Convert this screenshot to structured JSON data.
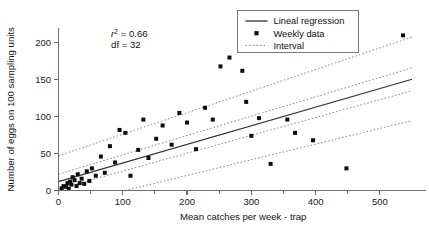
{
  "chart_data": {
    "type": "scatter",
    "title": "",
    "xlabel": "Mean catches per week - trap",
    "ylabel": "Number of eggs on 100 sampling units",
    "xlim": [
      0,
      550
    ],
    "ylim": [
      0,
      220
    ],
    "xticks": [
      0,
      100,
      200,
      300,
      400,
      500
    ],
    "yticks": [
      0,
      50,
      100,
      150,
      200
    ],
    "xticklabels": [
      "0",
      "100",
      "200",
      "300",
      "400",
      "500"
    ],
    "yticklabels": [
      "0",
      "50",
      "100",
      "150",
      "200"
    ],
    "grid": false,
    "legend_position": "top-right",
    "annotations": [
      {
        "id": "r-squared",
        "text": "r² = 0.66",
        "symbol": "r",
        "superscript": "2",
        "equals": " = 0.66",
        "x": 60,
        "y": 208
      },
      {
        "id": "degrees-freedom",
        "text": "df = 32",
        "x": 60,
        "y": 193
      }
    ],
    "series": [
      {
        "name": "Weekly data",
        "type": "scatter",
        "marker": "square",
        "color": "#0d0d0d",
        "points": [
          [
            5,
            3
          ],
          [
            8,
            6
          ],
          [
            12,
            5
          ],
          [
            14,
            10
          ],
          [
            16,
            2
          ],
          [
            18,
            12
          ],
          [
            20,
            8
          ],
          [
            22,
            18
          ],
          [
            25,
            14
          ],
          [
            28,
            6
          ],
          [
            30,
            22
          ],
          [
            33,
            10
          ],
          [
            36,
            16
          ],
          [
            40,
            9
          ],
          [
            44,
            26
          ],
          [
            48,
            13
          ],
          [
            52,
            30
          ],
          [
            58,
            20
          ],
          [
            66,
            46
          ],
          [
            72,
            24
          ],
          [
            80,
            60
          ],
          [
            88,
            38
          ],
          [
            95,
            82
          ],
          [
            104,
            78
          ],
          [
            112,
            20
          ],
          [
            124,
            55
          ],
          [
            132,
            96
          ],
          [
            140,
            44
          ],
          [
            152,
            70
          ],
          [
            162,
            88
          ],
          [
            176,
            62
          ],
          [
            188,
            105
          ],
          [
            200,
            92
          ],
          [
            214,
            56
          ],
          [
            228,
            112
          ],
          [
            240,
            96
          ],
          [
            252,
            168
          ],
          [
            266,
            180
          ],
          [
            286,
            162
          ],
          [
            292,
            120
          ],
          [
            300,
            74
          ],
          [
            312,
            98
          ],
          [
            330,
            36
          ],
          [
            356,
            96
          ],
          [
            368,
            78
          ],
          [
            396,
            68
          ],
          [
            448,
            30
          ],
          [
            536,
            210
          ]
        ]
      },
      {
        "name": "Lineal regression",
        "type": "line",
        "style": "solid",
        "color": "#333333",
        "intercept": 12,
        "slope": 0.252,
        "x_range": [
          0,
          550
        ]
      },
      {
        "name": "Interval",
        "type": "band",
        "style": "dotted",
        "color": "#8a8a8a",
        "upper": {
          "intercept": 47,
          "slope": 0.292,
          "x_range": [
            0,
            550
          ]
        },
        "lower": {
          "intercept": -22,
          "slope": 0.212,
          "x_range": [
            0,
            550
          ]
        },
        "inner_upper": {
          "intercept": 22,
          "slope": 0.262,
          "x_range": [
            0,
            550
          ]
        },
        "inner_lower": {
          "intercept": 2,
          "slope": 0.242,
          "x_range": [
            0,
            550
          ]
        }
      }
    ]
  },
  "legend": {
    "entries": [
      {
        "label": "Lineal regression",
        "marker": "line-solid"
      },
      {
        "label": "Weekly data",
        "marker": "square"
      },
      {
        "label": "Interval",
        "marker": "line-dotted"
      }
    ]
  }
}
